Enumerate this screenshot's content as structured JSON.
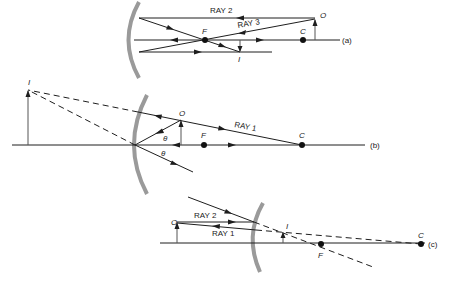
{
  "figure": {
    "panels": [
      {
        "id": "a",
        "tag": "(a)",
        "mirror": "concave",
        "labels": {
          "ray2": "RAY 2",
          "ray3": "RAY 3",
          "object": "O",
          "focal": "F",
          "center": "C",
          "image": "I"
        }
      },
      {
        "id": "b",
        "tag": "(b)",
        "mirror": "concave",
        "labels": {
          "ray1": "RAY 1",
          "object": "O",
          "focal": "F",
          "center": "C",
          "image": "I",
          "angle1": "θ",
          "angle2": "θ"
        }
      },
      {
        "id": "c",
        "tag": "(c)",
        "mirror": "convex",
        "labels": {
          "ray1": "RAY 1",
          "ray2": "RAY 2",
          "object": "O",
          "focal": "F",
          "center": "C",
          "image": "I"
        }
      }
    ],
    "colors": {
      "line": "#1e1e1e",
      "mirror": "#9a9a9a",
      "background": "#ffffff"
    }
  }
}
